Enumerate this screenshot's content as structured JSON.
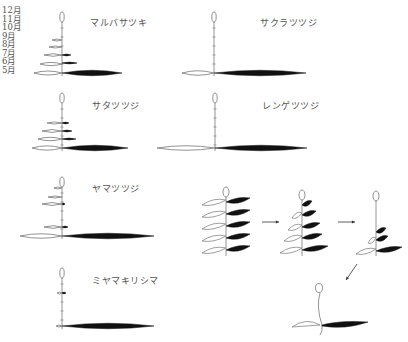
{
  "axis": {
    "months": [
      "12月",
      "11月",
      "10月",
      "9月",
      "8月",
      "7月",
      "6月",
      "5月"
    ],
    "month_y": [
      11,
      20,
      28,
      37,
      45,
      54,
      62,
      71
    ]
  },
  "species": [
    {
      "name": "マルバサツキ",
      "label_pos": [
        90,
        22
      ],
      "stem_x": 62,
      "top_y": 14,
      "base_y": 73,
      "white_leaves": [
        [
          73,
          28
        ],
        [
          64,
          22
        ],
        [
          55,
          18
        ],
        [
          47,
          13
        ],
        [
          40,
          10
        ]
      ],
      "black_leaves": [
        [
          73,
          60
        ],
        [
          63,
          15
        ],
        [
          55,
          9
        ]
      ]
    },
    {
      "name": "サクラツツジ",
      "label_pos": [
        260,
        22
      ],
      "stem_x": 214,
      "top_y": 14,
      "base_y": 73,
      "white_leaves": [
        [
          73,
          32
        ]
      ],
      "black_leaves": [
        [
          73,
          92
        ]
      ]
    },
    {
      "name": "サタツツジ",
      "label_pos": [
        92,
        105
      ],
      "stem_x": 62,
      "top_y": 95,
      "base_y": 148,
      "white_leaves": [
        [
          148,
          30
        ],
        [
          139,
          24
        ],
        [
          131,
          20
        ],
        [
          123,
          15
        ]
      ],
      "black_leaves": [
        [
          148,
          66
        ],
        [
          139,
          14
        ],
        [
          131,
          10
        ],
        [
          123,
          7
        ]
      ]
    },
    {
      "name": "レンゲツツジ",
      "label_pos": [
        262,
        105
      ],
      "stem_x": 215,
      "top_y": 95,
      "base_y": 148,
      "white_leaves": [
        [
          148,
          58
        ]
      ],
      "black_leaves": [
        [
          148,
          92
        ]
      ]
    },
    {
      "name": "ヤマツツジ",
      "label_pos": [
        92,
        188
      ],
      "stem_x": 62,
      "top_y": 179,
      "base_y": 236,
      "white_leaves": [
        [
          236,
          42
        ],
        [
          227,
          18
        ],
        [
          204,
          20
        ],
        [
          197,
          14
        ],
        [
          188,
          8
        ]
      ],
      "black_leaves": [
        [
          236,
          92
        ],
        [
          227,
          6
        ],
        [
          204,
          3
        ]
      ]
    },
    {
      "name": "ミヤマキリシマ",
      "label_pos": [
        92,
        280
      ],
      "stem_x": 62,
      "top_y": 270,
      "base_y": 326,
      "white_leaves": [
        [
          326,
          6
        ],
        [
          293,
          5
        ]
      ],
      "black_leaves": [
        [
          326,
          92
        ],
        [
          293,
          4
        ]
      ]
    }
  ],
  "sequence": {
    "arrow_color": "#333333",
    "stages": [
      {
        "stem_x": 226,
        "top_y": 189,
        "base_y": 256,
        "leaves": [
          [
            202,
            24,
            24
          ],
          [
            214,
            24,
            24
          ],
          [
            226,
            24,
            24
          ],
          [
            238,
            24,
            24
          ],
          [
            250,
            24,
            24
          ]
        ]
      },
      {
        "stem_x": 302,
        "top_y": 192,
        "base_y": 256,
        "leaves": [
          [
            205,
            0,
            10
          ],
          [
            215,
            10,
            14
          ],
          [
            227,
            14,
            18
          ],
          [
            238,
            18,
            20
          ],
          [
            250,
            22,
            26
          ]
        ]
      },
      {
        "stem_x": 376,
        "top_y": 193,
        "base_y": 256,
        "leaves": [
          [
            232,
            0,
            10
          ],
          [
            240,
            8,
            12
          ],
          [
            251,
            20,
            26
          ]
        ]
      }
    ],
    "final": {
      "stem_x": 320,
      "top_y": 285,
      "base_y": 335,
      "leaf_y": 325
    }
  },
  "colors": {
    "line": "#888888",
    "leaf_outline": "#777777",
    "leaf_fill": "#111111",
    "text": "#555555"
  }
}
